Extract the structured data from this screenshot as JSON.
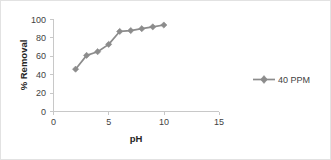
{
  "chart_data": {
    "type": "line",
    "title": "",
    "xlabel": "pH",
    "ylabel": "% Removal",
    "xlim": [
      0,
      15
    ],
    "ylim": [
      0,
      100
    ],
    "xticks": [
      0,
      5,
      10,
      15
    ],
    "yticks": [
      0,
      20,
      40,
      60,
      80,
      100
    ],
    "xtick_labels": [
      "0",
      "5",
      "10",
      "15"
    ],
    "ytick_labels": [
      "0",
      "20",
      "40",
      "60",
      "80",
      "100"
    ],
    "grid": false,
    "legend_position": "right",
    "series": [
      {
        "name": "40 PPM",
        "color": "#8c8c8c",
        "marker": "diamond",
        "x": [
          2,
          3,
          4,
          5,
          6,
          7,
          8,
          9,
          10
        ],
        "values": [
          46,
          61,
          65,
          73,
          87,
          88,
          90,
          92,
          94
        ]
      }
    ]
  },
  "legend": {
    "entries": [
      {
        "label": "40 PPM"
      }
    ]
  },
  "axis": {
    "x_title": "pH",
    "y_title": "% Removal"
  }
}
